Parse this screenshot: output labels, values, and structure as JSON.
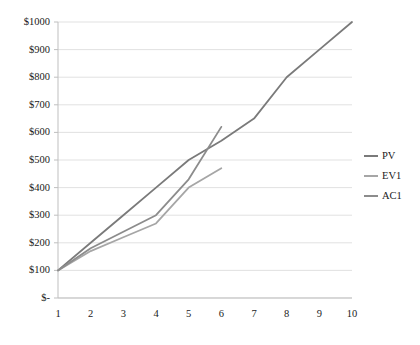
{
  "chart_data": {
    "type": "line",
    "title": "",
    "xlabel": "",
    "ylabel": "",
    "x": [
      1,
      2,
      3,
      4,
      5,
      6,
      7,
      8,
      9,
      10
    ],
    "xlim": [
      1,
      10
    ],
    "ylim": [
      0,
      1000
    ],
    "grid": true,
    "legend_position": "right",
    "x_tick_labels": [
      "1",
      "2",
      "3",
      "4",
      "5",
      "6",
      "7",
      "8",
      "9",
      "10"
    ],
    "y_tick_values": [
      0,
      100,
      200,
      300,
      400,
      500,
      600,
      700,
      800,
      900,
      1000
    ],
    "y_tick_labels": [
      "$-",
      "$100",
      "$200",
      "$300",
      "$400",
      "$500",
      "$600",
      "$700",
      "$800",
      "$900",
      "$1000"
    ],
    "series": [
      {
        "name": "PV",
        "color": "#7a7a7a",
        "x": [
          1,
          2,
          3,
          4,
          5,
          6,
          7,
          8,
          9,
          10
        ],
        "values": [
          100,
          200,
          300,
          400,
          500,
          570,
          650,
          800,
          900,
          1000
        ]
      },
      {
        "name": "EV1",
        "color": "#a6a6a6",
        "x": [
          1,
          2,
          3,
          4,
          5,
          6
        ],
        "values": [
          100,
          170,
          220,
          270,
          400,
          470
        ]
      },
      {
        "name": "AC1",
        "color": "#8c8c8c",
        "x": [
          1,
          2,
          3,
          4,
          5,
          6
        ],
        "values": [
          100,
          180,
          240,
          300,
          430,
          620
        ]
      }
    ]
  },
  "legend": {
    "items": [
      {
        "label": "PV"
      },
      {
        "label": "EV1"
      },
      {
        "label": "AC1"
      }
    ]
  },
  "colors": {
    "gridline": "#d9d9d9",
    "axis": "#bfbfbf",
    "text": "#1a1a1a",
    "background": "#ffffff"
  }
}
